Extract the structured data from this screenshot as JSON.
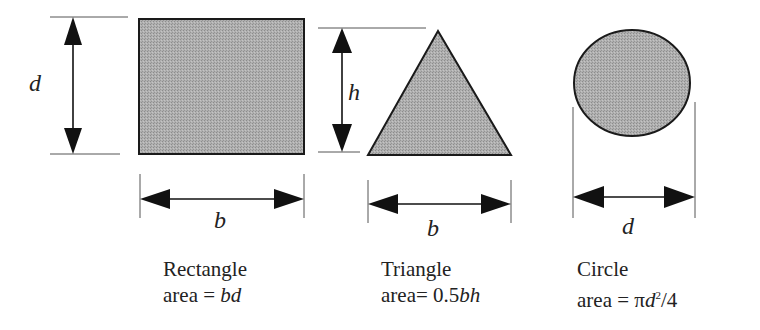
{
  "diagram": {
    "shapes": [
      {
        "id": "rectangle",
        "name": "Rectangle",
        "area_prefix": "area = ",
        "area_formula": "bd",
        "dimensions": {
          "height_label": "d",
          "width_label": "b"
        }
      },
      {
        "id": "triangle",
        "name": "Triangle",
        "area_prefix": "area= 0.5",
        "area_formula": "bh",
        "dimensions": {
          "height_label": "h",
          "width_label": "b"
        }
      },
      {
        "id": "circle",
        "name": "Circle",
        "area_prefix": "area = π",
        "area_formula": "d",
        "area_exponent": "2",
        "area_suffix": "/4",
        "dimensions": {
          "diameter_label": "d"
        }
      }
    ],
    "colors": {
      "fill": "#a9a9a9",
      "stroke": "#1a1a1a",
      "dim_line": "#555555",
      "text": "#222222"
    }
  }
}
